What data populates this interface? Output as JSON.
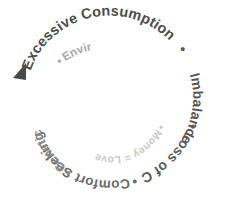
{
  "diagram": {
    "background_color": "#ffffff",
    "start_marker": {
      "name": "start-arrow",
      "shape": "triangle",
      "color": "#4a4a4a",
      "points_direction": "down-left"
    },
    "separator": "•",
    "segments": [
      {
        "index": 0,
        "label": "Excessive Consumption",
        "color": "#4d4d4d",
        "ring": "outer"
      },
      {
        "index": 1,
        "label": "Imbalance",
        "color": "#555555",
        "ring": "outer"
      },
      {
        "index": 2,
        "label": "Loss of Control",
        "color": "#5c5c5c",
        "ring": "outer"
      },
      {
        "index": 3,
        "label": "Comfort Seeking",
        "color": "#6b6b6b",
        "ring": "outer"
      },
      {
        "index": 4,
        "label": "Genetics and Family Patterns",
        "color": "#8f8f8f",
        "ring": "middle"
      },
      {
        "index": 5,
        "label": "Environmental Influences",
        "color": "#a8a8a8",
        "ring": "middle"
      },
      {
        "index": 6,
        "label": "Money = Love and Food = Love",
        "color": "#c9c9c9",
        "ring": "inner"
      }
    ],
    "full_text": "Excessive Consumption • Imbalance • Loss of Control • Comfort Seeking • Genetics and Family Patterns • Environmental Influences • Money = Love and Food = Love",
    "path_text": "▶ Excessive Consumption • Imbalance • Loss of Control • Comfort Seeking • Genetics and Family Patterns • Environmental Influences • Money = Love and Food = Love"
  }
}
